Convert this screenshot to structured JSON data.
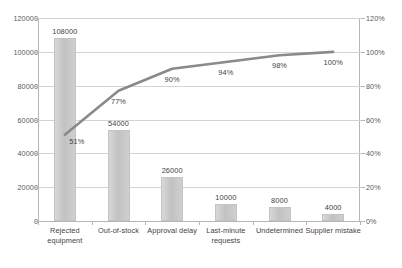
{
  "chart_data": {
    "type": "bar",
    "title": "",
    "subtitle": "",
    "xlabel": "",
    "ylabel": "",
    "y2label": "",
    "grid": true,
    "legend": "none",
    "categories": [
      "Rejected equipment",
      "Out-of-stock",
      "Approval delay",
      "Last-minute requests",
      "Undetermined",
      "Supplier mistake"
    ],
    "category_lines": [
      [
        "Rejected",
        "equipment"
      ],
      [
        "Out-of-stock"
      ],
      [
        "Approval delay"
      ],
      [
        "Last-minute",
        "requests"
      ],
      [
        "Undetermined"
      ],
      [
        "Supplier mistake"
      ]
    ],
    "series": [
      {
        "name": "Count",
        "type": "bar",
        "axis": "left",
        "values": [
          108000,
          54000,
          26000,
          10000,
          8000,
          4000
        ],
        "value_labels": [
          "108000",
          "54000",
          "26000",
          "10000",
          "8000",
          "4000"
        ]
      },
      {
        "name": "Cumulative percentage",
        "type": "line",
        "axis": "right",
        "values": [
          51,
          77,
          90,
          94,
          98,
          100
        ],
        "value_labels": [
          "51%",
          "77%",
          "90%",
          "94%",
          "98%",
          "100%"
        ]
      }
    ],
    "ylim": [
      0,
      120000
    ],
    "yticks": [
      0,
      20000,
      40000,
      60000,
      80000,
      100000,
      120000
    ],
    "ytick_labels": [
      "0",
      "20000",
      "40000",
      "60000",
      "80000",
      "100000",
      "120000"
    ],
    "y2lim": [
      0,
      120
    ],
    "y2ticks": [
      0,
      20,
      40,
      60,
      80,
      100,
      120
    ],
    "y2tick_labels": [
      "0%",
      "20%",
      "40%",
      "60%",
      "80%",
      "100%",
      "120%"
    ],
    "colors": {
      "bar_fill": "#c9c9c9",
      "bar_border": "#c4c4c4",
      "line": "#8a8a8a",
      "gridline": "#d3d3d3",
      "axis": "#b6b6b6",
      "text": "#3f3f3f",
      "tick_text": "#595959",
      "background": "#ffffff"
    }
  }
}
